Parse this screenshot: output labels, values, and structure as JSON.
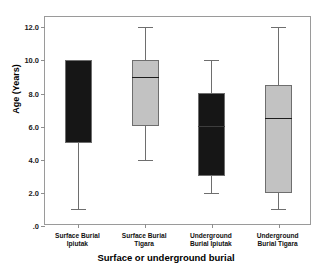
{
  "chart_data": {
    "type": "box",
    "title": "",
    "xlabel": "Surface or underground burial",
    "ylabel": "Age (Years)",
    "ylim": [
      0,
      12.6
    ],
    "yticks": [
      0,
      2,
      4,
      6,
      8,
      10,
      12
    ],
    "ytick_labels": [
      ".0",
      "2.0",
      "4.0",
      "6.0",
      "8.0",
      "10.0",
      "12.0"
    ],
    "grid": false,
    "legend": "none",
    "categories": [
      "Surface Burial Ipiutak",
      "Surface Burial Tigara",
      "Underground Burial Ipiutak",
      "Underground Burial Tigara"
    ],
    "boxes": [
      {
        "category": "Surface Burial Ipiutak",
        "label_line1": "Surface Burial",
        "label_line2": "Ipiutak",
        "whisker_low": 1.0,
        "q1": 5.0,
        "median": 10.0,
        "q3": 10.0,
        "whisker_high": 10.0,
        "fill": "#161616",
        "median_visible": false
      },
      {
        "category": "Surface Burial Tigara",
        "label_line1": "Surface Burial",
        "label_line2": "Tigara",
        "whisker_low": 4.0,
        "q1": 6.0,
        "median": 9.0,
        "q3": 10.0,
        "whisker_high": 12.0,
        "fill": "#c2c2c2",
        "median_visible": true
      },
      {
        "category": "Underground Burial Ipiutak",
        "label_line1": "Underground",
        "label_line2": "Burial Ipiutak",
        "whisker_low": 2.0,
        "q1": 3.0,
        "median": 6.0,
        "q3": 8.0,
        "whisker_high": 10.0,
        "fill": "#161616",
        "median_visible": true
      },
      {
        "category": "Underground Burial Tigara",
        "label_line1": "Underground",
        "label_line2": "Burial Tigara",
        "whisker_low": 1.0,
        "q1": 2.0,
        "median": 6.5,
        "q3": 8.5,
        "whisker_high": 12.0,
        "fill": "#c2c2c2",
        "median_visible": true
      }
    ],
    "colors": {
      "dark_box": "#161616",
      "light_box": "#c2c2c2",
      "outline": "#6e6e6e",
      "frame": "#9a9a9a",
      "background": "#ffffff",
      "text": "#000000"
    }
  }
}
